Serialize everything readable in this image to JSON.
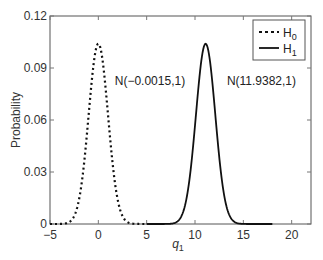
{
  "chart_data": {
    "type": "line",
    "title": "",
    "xlabel": "q1",
    "xlabel_main": "q",
    "xlabel_sub": "1",
    "ylabel": "Probability",
    "xlim": [
      -5,
      22
    ],
    "ylim": [
      0,
      0.12
    ],
    "xticks": [
      -5,
      0,
      5,
      10,
      15,
      20
    ],
    "xtick_labels": [
      "−5",
      "0",
      "5",
      "10",
      "15",
      "20"
    ],
    "yticks": [
      0,
      0.03,
      0.06,
      0.09,
      0.12
    ],
    "ytick_labels": [
      "0",
      "0.03",
      "0.06",
      "0.09",
      "0.12"
    ],
    "grid": false,
    "legend_position": "upper right",
    "series": [
      {
        "name": "H0",
        "legend_main": "H",
        "legend_sub": "0",
        "style": "dotted",
        "distribution": "Gaussian",
        "mean": 0.0,
        "peak": 0.104,
        "x": [
          -5,
          -4,
          -3,
          -2,
          -1,
          -0.5,
          0,
          0.5,
          1,
          2,
          3,
          4,
          5
        ],
        "values": [
          0.0,
          0.0,
          0.001,
          0.014,
          0.063,
          0.092,
          0.104,
          0.092,
          0.063,
          0.014,
          0.001,
          0.0,
          0.0
        ]
      },
      {
        "name": "H1",
        "legend_main": "H",
        "legend_sub": "1",
        "style": "solid",
        "distribution": "Gaussian",
        "mean": 11.1,
        "peak": 0.104,
        "x": [
          5,
          7,
          8,
          9,
          10,
          10.6,
          11.1,
          11.6,
          12,
          13,
          14,
          15,
          18
        ],
        "values": [
          0.0,
          0.0,
          0.001,
          0.012,
          0.057,
          0.092,
          0.104,
          0.092,
          0.069,
          0.017,
          0.002,
          0.0,
          0.0
        ]
      }
    ],
    "annotations": [
      {
        "text": "N(−0.0015,1)",
        "x": 1.7,
        "y": 0.08
      },
      {
        "text": "N(11.9382,1)",
        "x": 13.3,
        "y": 0.08
      }
    ]
  }
}
